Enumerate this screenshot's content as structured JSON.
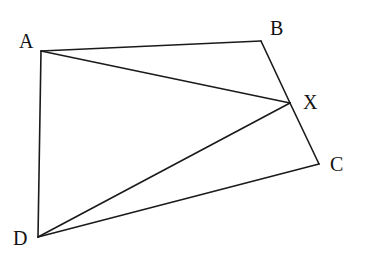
{
  "diagram": {
    "type": "geometry",
    "stroke_color": "#1a1a1a",
    "background": "#ffffff",
    "points": {
      "A": {
        "label": "A",
        "x": 41,
        "y": 51,
        "label_x": 19,
        "label_y": 48
      },
      "B": {
        "label": "B",
        "x": 261,
        "y": 41,
        "label_x": 270,
        "label_y": 35
      },
      "X": {
        "label": "X",
        "x": 290,
        "y": 103,
        "label_x": 303,
        "label_y": 109
      },
      "C": {
        "label": "C",
        "x": 319,
        "y": 164,
        "label_x": 330,
        "label_y": 171
      },
      "D": {
        "label": "D",
        "x": 38,
        "y": 237,
        "label_x": 13,
        "label_y": 245
      }
    },
    "segments": [
      {
        "name": "AB",
        "from": "A",
        "to": "B"
      },
      {
        "name": "BX",
        "from": "B",
        "to": "X"
      },
      {
        "name": "XC",
        "from": "X",
        "to": "C"
      },
      {
        "name": "CD",
        "from": "C",
        "to": "D"
      },
      {
        "name": "DA",
        "from": "D",
        "to": "A"
      },
      {
        "name": "AX",
        "from": "A",
        "to": "X"
      },
      {
        "name": "DX",
        "from": "D",
        "to": "X"
      }
    ],
    "labels": [
      "A",
      "B",
      "X",
      "C",
      "D"
    ]
  }
}
